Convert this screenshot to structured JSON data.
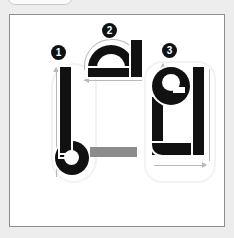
{
  "card": {
    "title": "Stroke order guide",
    "background_color": "#ffffff",
    "border_color": "#8e8e8e",
    "page_background_color": "#ededed"
  },
  "top_sliver": {
    "name": "cut-off-pill-above-card",
    "visible_label": ""
  },
  "separator": {
    "name": "gray-dash",
    "shape": "horizontal-bar",
    "color": "#8c8c8c",
    "label": "—"
  },
  "stroke_color": "#111111",
  "guide_color": "#b9b9b9",
  "badge": {
    "background_color": "#111111",
    "text_color": "#ffffff"
  },
  "glyphs": [
    {
      "order": "1",
      "badge_label": "1",
      "name": "glyph-stroke-1",
      "description": "vertical stem descending into a filled ring at the foot",
      "direction": "top-to-bottom",
      "position": "left"
    },
    {
      "order": "2",
      "badge_label": "2",
      "name": "glyph-stroke-2",
      "description": "arch over a flat baseline with a short vertical stem at the right",
      "direction": "left-to-right over the arch, then right-to-left along the base",
      "position": "top-center"
    },
    {
      "order": "3",
      "badge_label": "3",
      "name": "glyph-stroke-3",
      "description": "spiral loop head flowing into a U bowl with a tall right stem",
      "direction": "top-down, around the bowl, left-to-right along the base",
      "position": "right"
    }
  ]
}
